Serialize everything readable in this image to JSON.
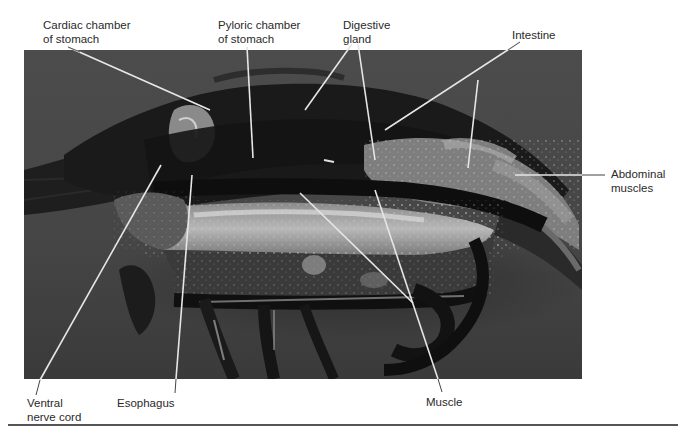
{
  "figure": {
    "colors": {
      "background": "#ffffff",
      "photo_background": "#4a4a4a",
      "leader_line": "#e8e8e8",
      "label_text": "#2a2a2a",
      "bottom_rule": "#555555"
    },
    "labels": [
      {
        "id": "cardiac",
        "line1": "Cardiac chamber",
        "line2": "of stomach"
      },
      {
        "id": "pyloric",
        "line1": "Pyloric chamber",
        "line2": "of stomach"
      },
      {
        "id": "digestive",
        "line1": "Digestive",
        "line2": "gland"
      },
      {
        "id": "intestine",
        "line1": "Intestine",
        "line2": ""
      },
      {
        "id": "abdominal",
        "line1": "Abdominal",
        "line2": "muscles"
      },
      {
        "id": "ventral",
        "line1": "Ventral",
        "line2": "nerve cord"
      },
      {
        "id": "esophagus",
        "line1": "Esophagus",
        "line2": ""
      },
      {
        "id": "muscle",
        "line1": "Muscle",
        "line2": ""
      }
    ]
  }
}
